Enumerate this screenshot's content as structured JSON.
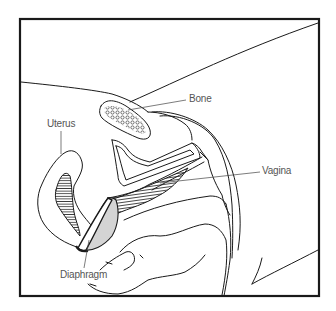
{
  "figure": {
    "frame_color": "#1a1a1a",
    "line_color": "#1a1a1a",
    "diaphragm_fill": "#d4d4d4",
    "label_color": "#555555",
    "labels": {
      "bone": "Bone",
      "uterus": "Uterus",
      "vagina": "Vagina",
      "diaphragm": "Diaphragm"
    }
  }
}
